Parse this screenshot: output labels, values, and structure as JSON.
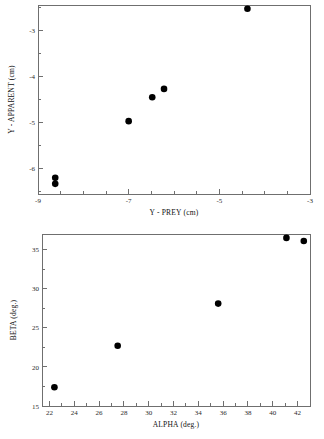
{
  "figure": {
    "panels": [
      "top",
      "bottom"
    ],
    "background": "#ffffff",
    "point_color": "#000000",
    "axis_color": "#6f6f6f"
  },
  "chart_data": [
    {
      "id": "top",
      "type": "scatter",
      "title": "",
      "xlabel": "Y - PREY (cm)",
      "ylabel": "Y - APPARENT (cm)",
      "xlim": [
        -9,
        -3
      ],
      "ylim": [
        -6.55,
        -2.45
      ],
      "xticks": [
        -9,
        -7,
        -5,
        -3
      ],
      "xticklabels": [
        "-9",
        "-7",
        "-5",
        "-3"
      ],
      "xminorticks": [
        -8.5,
        -8,
        -7.5,
        -6.5,
        -6,
        -5.5,
        -4.5,
        -4,
        -3.5
      ],
      "yticks": [
        -3,
        -4,
        -5,
        -6
      ],
      "yticklabels": [
        "-3",
        "-4",
        "-5",
        "-6"
      ],
      "yminorticks": [
        -3.5,
        -4.5,
        -5.5,
        -6.5,
        -2.5
      ],
      "grid": false,
      "legend": false,
      "points": [
        {
          "x": -8.62,
          "y": -6.2
        },
        {
          "x": -8.62,
          "y": -6.33
        },
        {
          "x": -7.0,
          "y": -4.97
        },
        {
          "x": -6.48,
          "y": -4.45
        },
        {
          "x": -6.22,
          "y": -4.27
        },
        {
          "x": -4.38,
          "y": -2.53
        }
      ]
    },
    {
      "id": "bottom",
      "type": "scatter",
      "title": "",
      "xlabel": "ALPHA (deg.)",
      "ylabel": "BETA (deg.)",
      "xlim": [
        21.4,
        43.0
      ],
      "ylim": [
        15.0,
        37.0
      ],
      "xticks": [
        22,
        24,
        26,
        28,
        30,
        32,
        34,
        36,
        38,
        40,
        42
      ],
      "xticklabels": [
        "22",
        "24",
        "26",
        "28",
        "30",
        "32",
        "34",
        "36",
        "38",
        "40",
        "42"
      ],
      "xminorticks": [
        23,
        25,
        27,
        29,
        31,
        33,
        35,
        37,
        39,
        41,
        43
      ],
      "yticks": [
        15,
        20,
        25,
        30,
        35
      ],
      "yticklabels": [
        "15",
        "20",
        "25",
        "30",
        "35"
      ],
      "yminorticks": [
        17.5,
        22.5,
        27.5,
        32.5
      ],
      "grid": false,
      "legend": false,
      "points": [
        {
          "x": 22.4,
          "y": 17.4
        },
        {
          "x": 27.5,
          "y": 22.7
        },
        {
          "x": 35.6,
          "y": 28.1
        },
        {
          "x": 41.1,
          "y": 36.5
        },
        {
          "x": 42.5,
          "y": 36.1
        }
      ]
    }
  ]
}
